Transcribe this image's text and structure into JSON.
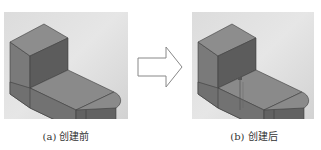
{
  "figure": {
    "panels": [
      {
        "id": "a",
        "caption": "(a) 创建前",
        "content": "3D L-shaped block with rounded end, before feature creation",
        "has_point_marker": false
      },
      {
        "id": "b",
        "caption": "(b) 创建后",
        "content": "3D L-shaped block with rounded end, after feature creation, with small point marker and vertical line",
        "has_point_marker": true
      }
    ],
    "arrow": {
      "icon": "right-arrow-outline-icon",
      "direction": "right"
    }
  },
  "colors": {
    "background": "#ffffff",
    "panel_bg": "#dedede",
    "face_top": "#8c8c8c",
    "face_front": "#6f6f6f",
    "face_side": "#5a5a5a",
    "edge": "#3c3c3c",
    "arrow_stroke": "#888888",
    "caption_text": "#333333"
  }
}
